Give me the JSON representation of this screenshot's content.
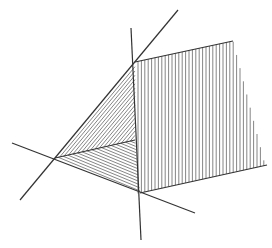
{
  "figure": {
    "colors": {
      "line": "#333333",
      "hatch": "#666666",
      "background": "#ffffff"
    }
  }
}
